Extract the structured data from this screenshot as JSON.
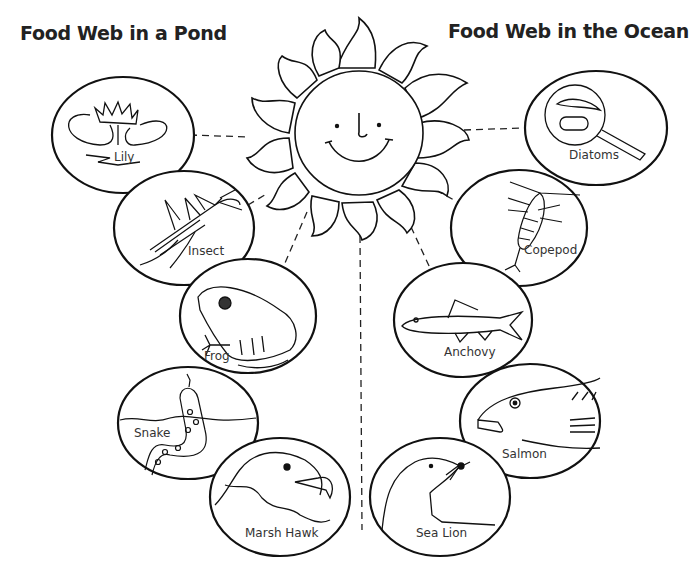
{
  "titles": {
    "pond": "Food Web in a Pond",
    "ocean": "Food Web in the Ocean"
  },
  "center": {
    "name": "Sun",
    "icon": "smiling-sun-icon"
  },
  "pond": {
    "organisms": [
      {
        "label": "Lily",
        "icon": "water-lily-icon"
      },
      {
        "label": "Insect",
        "icon": "mosquito-icon"
      },
      {
        "label": "Frog",
        "icon": "frog-icon"
      },
      {
        "label": "Snake",
        "icon": "water-snake-icon"
      },
      {
        "label": "Marsh Hawk",
        "icon": "hawk-head-icon"
      }
    ]
  },
  "ocean": {
    "organisms": [
      {
        "label": "Diatoms",
        "icon": "magnified-diatoms-icon"
      },
      {
        "label": "Copepod",
        "icon": "copepod-icon"
      },
      {
        "label": "Anchovy",
        "icon": "anchovy-fish-icon"
      },
      {
        "label": "Salmon",
        "icon": "salmon-head-icon"
      },
      {
        "label": "Sea Lion",
        "icon": "sea-lion-icon"
      }
    ]
  },
  "colors": {
    "line": "#111111",
    "background": "#ffffff",
    "text": "#333333"
  }
}
